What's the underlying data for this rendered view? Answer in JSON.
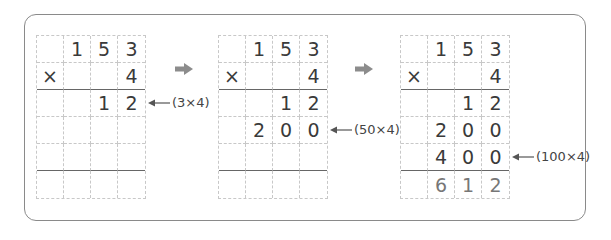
{
  "grids": [
    {
      "rows": [
        [
          "",
          "1",
          "5",
          "3"
        ],
        [
          "×",
          "",
          "",
          "4"
        ],
        [
          "",
          "",
          "1",
          "2"
        ],
        [
          "",
          "",
          "",
          ""
        ],
        [
          "",
          "",
          "",
          ""
        ],
        [
          "",
          "",
          "",
          ""
        ]
      ],
      "annotation": "(3×4)",
      "annotation_row": 2
    },
    {
      "rows": [
        [
          "",
          "1",
          "5",
          "3"
        ],
        [
          "×",
          "",
          "",
          "4"
        ],
        [
          "",
          "",
          "1",
          "2"
        ],
        [
          "",
          "2",
          "0",
          "0"
        ],
        [
          "",
          "",
          "",
          ""
        ],
        [
          "",
          "",
          "",
          ""
        ]
      ],
      "annotation": "(50×4)",
      "annotation_row": 3
    },
    {
      "rows": [
        [
          "",
          "1",
          "5",
          "3"
        ],
        [
          "×",
          "",
          "",
          "4"
        ],
        [
          "",
          "",
          "1",
          "2"
        ],
        [
          "",
          "2",
          "0",
          "0"
        ],
        [
          "",
          "4",
          "0",
          "0"
        ],
        [
          "",
          "6",
          "1",
          "2"
        ]
      ],
      "annotation": "(100×4)",
      "annotation_row": 4
    }
  ],
  "colors": {
    "arrow": "#8c8c8c",
    "frame": "#8a8a8a",
    "grid_line": "#c8c8c8"
  }
}
